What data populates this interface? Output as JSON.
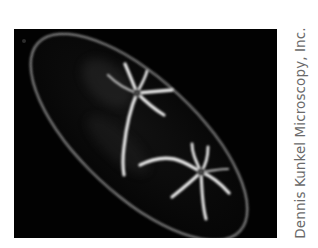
{
  "figure": {
    "background_color": "#020202",
    "structure_color": "#e6e6e6"
  },
  "credit": {
    "text": "Dennis Kunkel Microscopy, Inc."
  }
}
